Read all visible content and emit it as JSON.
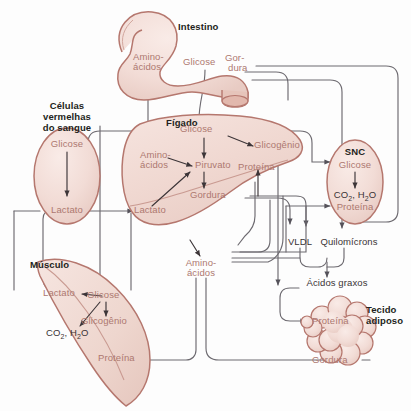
{
  "diagram": {
    "language": "pt-BR",
    "colors": {
      "background": "#fdfdfd",
      "organ_fill": "#f2dcd6",
      "organ_fill_light": "#f8ece8",
      "organ_outline": "#b5776e",
      "metabolite_text": "#ad7870",
      "organ_label_text": "#231f20",
      "neutral_text": "#3a3335",
      "connector_line": "#6d6a70",
      "arrow_internal": "#3c3538"
    }
  },
  "organs": [
    {
      "id": "intestino",
      "name": "Intestino",
      "metabolites": [
        "Amino-ácidos",
        "Glicose",
        "Gor-\ndura"
      ]
    },
    {
      "id": "celulas-vermelhas",
      "name": "Células\nvermelhas\ndo sangue",
      "metabolites": [
        "Glicose",
        "Lactato"
      ]
    },
    {
      "id": "figado",
      "name": "Fígado",
      "metabolites": [
        "Glicose",
        "Glicogênio",
        "Amino-ácidos",
        "Piruvato",
        "Proteína",
        "Gordura",
        "Lactato"
      ]
    },
    {
      "id": "snc",
      "name": "SNC",
      "metabolites": [
        "Glicose",
        "CO2, H2O",
        "Proteína"
      ]
    },
    {
      "id": "musculo",
      "name": "Músculo",
      "metabolites": [
        "Lactato",
        "Glicose",
        "Glicogênio",
        "CO2, H2O",
        "Proteína"
      ]
    },
    {
      "id": "tecido-adiposo",
      "name": "Tecido\nadiposo",
      "metabolites": [
        "Proteína",
        "Gordura"
      ]
    }
  ],
  "labels": {
    "intestino": "Intestino",
    "intestino_aminoacidos_l1": "Amino-",
    "intestino_aminoacidos_l2": "ácidos",
    "intestino_glicose": "Glicose",
    "intestino_gordura_l1": "Gor-",
    "intestino_gordura_l2": "dura",
    "rbc_l1": "Células",
    "rbc_l2": "vermelhas",
    "rbc_l3": "do sangue",
    "rbc_glicose": "Glicose",
    "rbc_lactato": "Lactato",
    "figado": "Fígado",
    "figado_glicose": "Glicose",
    "figado_glicogenio": "Glicogênio",
    "figado_aminoacidos_l1": "Amino-",
    "figado_aminoacidos_l2": "ácidos",
    "figado_piruvato": "Piruvato",
    "figado_proteina": "Proteína",
    "figado_gordura": "Gordura",
    "figado_lactato": "Lactato",
    "snc": "SNC",
    "snc_glicose": "Glicose",
    "snc_co2_pre": "CO",
    "snc_co2_sub": "2",
    "snc_co2_post": ", H",
    "snc_h2o_sub": "2",
    "snc_h2o_post": "O",
    "snc_proteina": "Proteína",
    "vldl": "VLDL",
    "quilomicrons": "Quilomícrons",
    "acidos_graxos": "Ácidos graxos",
    "musculo": "Músculo",
    "musculo_lactato": "Lactato",
    "musculo_glicose": "Glicose",
    "musculo_glicogenio": "Glicogênio",
    "musculo_proteina": "Proteína",
    "central_aminoacidos_l1": "Amino-",
    "central_aminoacidos_l2": "ácidos",
    "tecido_l1": "Tecido",
    "tecido_l2": "adiposo",
    "tecido_proteina": "Proteína",
    "tecido_gordura": "Gordura"
  },
  "flows": [
    {
      "from": "intestino.amino-acidos",
      "to": "figado.amino-acidos"
    },
    {
      "from": "intestino.glicose",
      "to": "figado.glicose"
    },
    {
      "from": "intestino.gordura",
      "to": "quilomicrons"
    },
    {
      "from": "figado.glicose",
      "to": "celulas-vermelhas.glicose"
    },
    {
      "from": "figado.glicose",
      "to": "snc.glicose"
    },
    {
      "from": "figado.glicose",
      "to": "figado.glicogenio"
    },
    {
      "from": "figado.glicose",
      "to": "figado.piruvato"
    },
    {
      "from": "figado.glicose",
      "to": "musculo.glicose"
    },
    {
      "from": "figado.piruvato",
      "to": "figado.gordura"
    },
    {
      "from": "figado.amino-acidos",
      "to": "figado.piruvato"
    },
    {
      "from": "figado.lactato",
      "to": "figado.piruvato"
    },
    {
      "from": "celulas-vermelhas.glicose",
      "to": "celulas-vermelhas.lactato"
    },
    {
      "from": "celulas-vermelhas.lactato",
      "to": "figado.lactato"
    },
    {
      "from": "musculo.lactato",
      "to": "celulas-vermelhas.lactato"
    },
    {
      "from": "musculo.glicose",
      "to": "musculo.lactato"
    },
    {
      "from": "musculo.glicose",
      "to": "musculo.glicogenio"
    },
    {
      "from": "musculo.glicose",
      "to": "musculo.co2-h2o"
    },
    {
      "from": "figado.gordura",
      "to": "vldl"
    },
    {
      "from": "vldl",
      "to": "acidos-graxos"
    },
    {
      "from": "quilomicrons",
      "to": "acidos-graxos"
    },
    {
      "from": "acidos-graxos",
      "to": "tecido-adiposo.proteina"
    },
    {
      "from": "central.amino-acidos",
      "to": "musculo.proteina"
    },
    {
      "from": "central.amino-acidos",
      "to": "snc.proteina"
    },
    {
      "from": "central.amino-acidos",
      "to": "tecido-adiposo.gordura"
    },
    {
      "from": "figado.proteina",
      "to": "central.amino-acidos"
    }
  ]
}
